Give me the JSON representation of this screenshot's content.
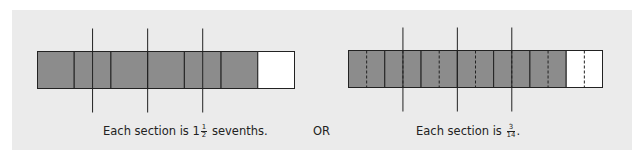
{
  "diagram": {
    "left": {
      "total_parts": 7,
      "shaded_parts": 6,
      "subdivided": false,
      "groups": 4,
      "caption": {
        "prefix": "Each section is ",
        "whole": "1",
        "num": "1",
        "den": "2",
        "suffix": " sevenths."
      }
    },
    "separator": "OR",
    "right": {
      "total_parts": 7,
      "shaded_parts": 6,
      "subdivided": true,
      "subdivisions_per_part": 2,
      "groups": 4,
      "caption": {
        "prefix": "Each section is ",
        "num": "3",
        "den": "14",
        "suffix": "."
      }
    },
    "colors": {
      "shaded": "#8c8c8c",
      "unshaded": "#ffffff",
      "line": "#222222",
      "background": "#ebebeb"
    }
  }
}
